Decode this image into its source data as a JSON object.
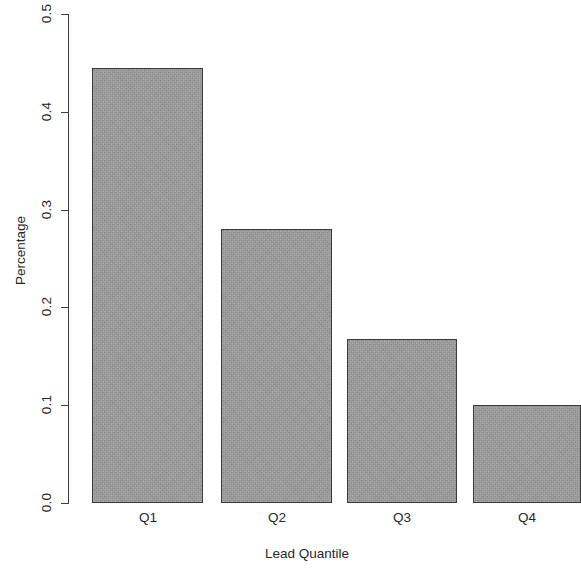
{
  "chart_data": {
    "type": "bar",
    "title": "",
    "xlabel": "Lead Quantile",
    "ylabel": "Percentage",
    "categories": [
      "Q1",
      "Q2",
      "Q3",
      "Q4"
    ],
    "values": [
      0.445,
      0.28,
      0.168,
      0.1
    ],
    "ylim": [
      0.0,
      0.5
    ],
    "ytick_labels": [
      "0.0",
      "0.1",
      "0.2",
      "0.3",
      "0.4",
      "0.5"
    ],
    "ytick_values": [
      0.0,
      0.1,
      0.2,
      0.3,
      0.4,
      0.5
    ],
    "grid": false,
    "legend": false,
    "bar_fill_color": "#9b9b9b",
    "bar_border_color": "#3a3a3a",
    "axis_color": "#3d3d3d",
    "background_color": "#ffffff"
  }
}
